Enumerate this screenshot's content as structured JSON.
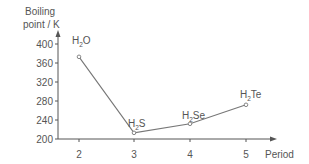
{
  "chart_data": {
    "type": "line",
    "title": "",
    "xlabel": "Period",
    "ylabel": "Boiling point / K",
    "ylabel_lines": [
      "Boiling",
      "point / K"
    ],
    "categories": [
      "2",
      "3",
      "4",
      "5"
    ],
    "x": [
      2,
      3,
      4,
      5
    ],
    "series": [
      {
        "name": "Hydrides of group 16",
        "values": [
          373,
          213,
          232,
          272
        ],
        "point_labels": [
          {
            "base": "H",
            "sub": "2",
            "rest": "O"
          },
          {
            "base": "H",
            "sub": "2",
            "rest": "S"
          },
          {
            "base": "H",
            "sub": "2",
            "rest": "Se"
          },
          {
            "base": "H",
            "sub": "2",
            "rest": "Te"
          }
        ]
      }
    ],
    "yticks": [
      200,
      240,
      280,
      320,
      360,
      400
    ],
    "ylim": [
      200,
      400
    ],
    "grid": false,
    "legend": "none",
    "colors": {
      "line": "#777777",
      "axis": "#555555",
      "text": "#555555"
    }
  }
}
